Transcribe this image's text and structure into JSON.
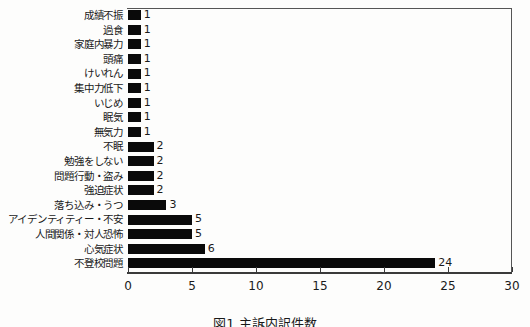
{
  "chart_data": {
    "type": "bar",
    "orientation": "horizontal",
    "title": "",
    "subtitle": "",
    "xlabel": "",
    "ylabel": "",
    "xlim": [
      0,
      30
    ],
    "xticks": [
      "0",
      "5",
      "10",
      "15",
      "20",
      "25",
      "30"
    ],
    "grid": false,
    "legend": null,
    "bar_color": "#0a0a0a",
    "categories": [
      "成績不振",
      "過食",
      "家庭内暴力",
      "頭痛",
      "けいれん",
      "集中力低下",
      "いじめ",
      "眠気",
      "無気力",
      "不眠",
      "勉強をしない",
      "問題行動・盗み",
      "強迫症状",
      "落ち込み・うつ",
      "アイデンティティー・不安",
      "人間関係・対人恐怖",
      "心気症状",
      "不登校問題"
    ],
    "values": [
      1,
      1,
      1,
      1,
      1,
      1,
      1,
      1,
      1,
      2,
      2,
      2,
      2,
      3,
      5,
      5,
      6,
      24
    ],
    "value_labels": [
      "1",
      "1",
      "1",
      "1",
      "1",
      "1",
      "1",
      "1",
      "1",
      "2",
      "2",
      "2",
      "2",
      "3",
      "5",
      "5",
      "6",
      "24"
    ]
  },
  "caption": {
    "text": "図1 主訴内訳件数"
  }
}
